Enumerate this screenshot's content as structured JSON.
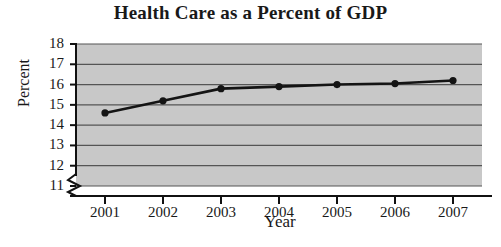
{
  "chart_data": {
    "type": "line",
    "title": "Health Care as a Percent of GDP",
    "xlabel": "Year",
    "ylabel": "Percent",
    "categories": [
      "2001",
      "2002",
      "2003",
      "2004",
      "2005",
      "2006",
      "2007"
    ],
    "x": [
      2001,
      2002,
      2003,
      2004,
      2005,
      2006,
      2007
    ],
    "values": [
      14.6,
      15.2,
      15.8,
      15.9,
      16.0,
      16.05,
      16.2
    ],
    "series": [
      {
        "name": "Health Care as a Percent of GDP",
        "values": [
          14.6,
          15.2,
          15.8,
          15.9,
          16.0,
          16.05,
          16.2
        ]
      }
    ],
    "ylim": [
      11,
      18
    ],
    "yticks": [
      11,
      12,
      13,
      14,
      15,
      16,
      17,
      18
    ],
    "ytick_labels": [
      "11",
      "12",
      "13",
      "14",
      "15",
      "16",
      "17",
      "18"
    ],
    "xtick_labels": [
      "2001",
      "2002",
      "2003",
      "2004",
      "2005",
      "2006",
      "2007"
    ],
    "grid": true,
    "grid_orientation": "horizontal",
    "legend": "none",
    "axis_break": true,
    "axis_break_axis": "y",
    "marker": "filled-circle",
    "plot_background_color": "#c8c8c8",
    "line_color": "#141414",
    "grid_color": "#555555",
    "axis_color": "#111111",
    "figure_background_color": "#ffffff"
  }
}
